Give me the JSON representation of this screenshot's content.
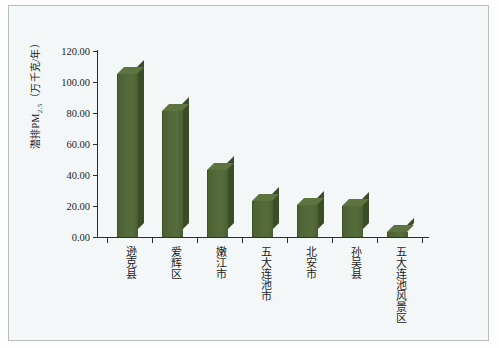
{
  "chart_data": {
    "type": "bar",
    "title": "",
    "xlabel": "",
    "ylabel": "潜排PM2.5（万千克/年）",
    "ylabel_main": "潜排PM",
    "ylabel_sub": "2.5",
    "ylabel_unit": "（万千克/年）",
    "ylim": [
      0,
      120
    ],
    "ytick_labels": [
      "120.00",
      "100.00",
      "80.00",
      "60.00",
      "40.00",
      "20.00",
      "0.00"
    ],
    "ytick_values": [
      120,
      100,
      80,
      60,
      40,
      20,
      0
    ],
    "grid": false,
    "legend": "none",
    "categories": [
      "逊克县",
      "爱辉区",
      "嫩江市",
      "五大连池市",
      "北安市",
      "孙吴县",
      "五大连池风景区"
    ],
    "values": [
      105.0,
      81.0,
      43.0,
      23.0,
      20.5,
      20.0,
      3.0
    ],
    "bar_color": "#53693a",
    "bar_side_color": "#3b4d26",
    "bar_top_color": "#5e7440",
    "background_color": "#f4f7f7",
    "axis_color": "#2e2e2e"
  }
}
